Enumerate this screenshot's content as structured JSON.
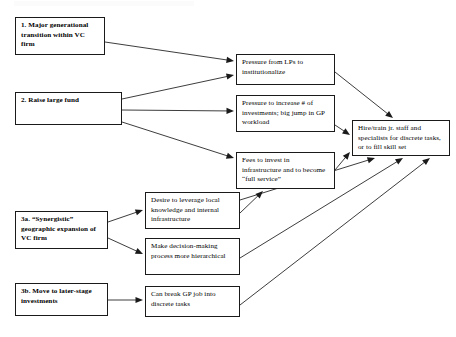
{
  "diagram": {
    "background_color": "#ffffff",
    "line_color": "#1a1a1a",
    "nodes": [
      {
        "id": "n1",
        "name": "major-generational-transition",
        "text": "1. Major generational transition within VC firm",
        "bold": true,
        "x": 15,
        "y": 17,
        "w": 90,
        "h": 38
      },
      {
        "id": "n2",
        "name": "raise-large-fund",
        "text": "2. Raise large fund",
        "bold": true,
        "x": 15,
        "y": 92,
        "w": 107,
        "h": 33
      },
      {
        "id": "n3a",
        "name": "synergistic-geographic-expansion",
        "text": "3a. “Synergistic” geographic expansion of VC firm",
        "bold": true,
        "x": 15,
        "y": 211,
        "w": 93,
        "h": 38
      },
      {
        "id": "n3b",
        "name": "move-to-later-stage-investments",
        "text": "3b. Move to later-stage investments",
        "bold": true,
        "x": 15,
        "y": 283,
        "w": 93,
        "h": 33
      },
      {
        "id": "m1",
        "name": "pressure-from-lps",
        "text": "Pressure from LPs to institutionalize",
        "bold": false,
        "x": 236,
        "y": 54,
        "w": 99,
        "h": 31
      },
      {
        "id": "m2",
        "name": "pressure-to-increase-investments",
        "text": "Pressure to increase # of investments;  big jump in GP workload",
        "bold": false,
        "x": 236,
        "y": 95,
        "w": 99,
        "h": 37
      },
      {
        "id": "m3",
        "name": "fees-to-invest-in-infrastructure",
        "text": "Fees to invest in infrastructure and to become “full service”",
        "bold": false,
        "x": 236,
        "y": 152,
        "w": 99,
        "h": 37
      },
      {
        "id": "m4",
        "name": "desire-to-leverage-local-knowledge",
        "text": "Desire to leverage local knowledge and internal infrastructure",
        "bold": false,
        "x": 145,
        "y": 192,
        "w": 95,
        "h": 37
      },
      {
        "id": "m5",
        "name": "make-decision-making-hierarchical",
        "text": "Make decision-making process more hierarchical",
        "bold": false,
        "x": 145,
        "y": 238,
        "w": 95,
        "h": 37
      },
      {
        "id": "m6",
        "name": "can-break-gp-job-into-discrete-tasks",
        "text": "Can break GP job into discrete tasks",
        "bold": false,
        "x": 145,
        "y": 286,
        "w": 95,
        "h": 31
      },
      {
        "id": "r1",
        "name": "hire-train-jr-staff-and-specialists",
        "text": "Hire/train jr. staff and specialists for discrete tasks, or to fill skill set",
        "bold": false,
        "x": 352,
        "y": 120,
        "w": 98,
        "h": 36
      }
    ],
    "edges": [
      {
        "name": "edge-n1-to-m1",
        "from": "n1",
        "to": "m1",
        "x1": 105,
        "y1": 42,
        "x2": 234,
        "y2": 61
      },
      {
        "name": "edge-n2-to-m1",
        "from": "n2",
        "to": "m1",
        "x1": 122,
        "y1": 99,
        "x2": 234,
        "y2": 75
      },
      {
        "name": "edge-n2-to-m2",
        "from": "n2",
        "to": "m2",
        "x1": 122,
        "y1": 110,
        "x2": 234,
        "y2": 111
      },
      {
        "name": "edge-n2-to-m3",
        "from": "n2",
        "to": "m3",
        "x1": 122,
        "y1": 122,
        "x2": 234,
        "y2": 158
      },
      {
        "name": "edge-n3a-to-m4",
        "from": "n3a",
        "to": "m4",
        "x1": 108,
        "y1": 222,
        "x2": 143,
        "y2": 210
      },
      {
        "name": "edge-n3a-to-m5",
        "from": "n3a",
        "to": "m5",
        "x1": 108,
        "y1": 238,
        "x2": 143,
        "y2": 254
      },
      {
        "name": "edge-n3b-to-m6",
        "from": "n3b",
        "to": "m6",
        "x1": 108,
        "y1": 300,
        "x2": 143,
        "y2": 300
      },
      {
        "name": "edge-m1-to-r1",
        "from": "m1",
        "to": "r1",
        "x1": 335,
        "y1": 72,
        "x2": 393,
        "y2": 118
      },
      {
        "name": "edge-m2-to-r1",
        "from": "m2",
        "to": "r1",
        "x1": 335,
        "y1": 125,
        "x2": 350,
        "y2": 135
      },
      {
        "name": "edge-m3-to-r1",
        "from": "m3",
        "to": "r1",
        "x1": 335,
        "y1": 170,
        "x2": 350,
        "y2": 152
      },
      {
        "name": "edge-m4-to-m3",
        "from": "m4",
        "to": "m3",
        "x1": 240,
        "y1": 213,
        "x2": 263,
        "y2": 191
      },
      {
        "name": "edge-m4-to-r1",
        "from": "m4",
        "to": "r1",
        "x1": 240,
        "y1": 200,
        "x2": 375,
        "y2": 158
      },
      {
        "name": "edge-m5-to-r1",
        "from": "m5",
        "to": "r1",
        "x1": 240,
        "y1": 258,
        "x2": 403,
        "y2": 158
      },
      {
        "name": "edge-m6-to-r1",
        "from": "m6",
        "to": "r1",
        "x1": 240,
        "y1": 305,
        "x2": 430,
        "y2": 158
      }
    ]
  }
}
